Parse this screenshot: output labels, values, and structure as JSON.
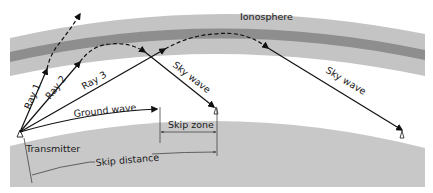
{
  "diagram": {
    "labels": {
      "ionosphere": "Ionosphere",
      "ray1": "Ray 1",
      "ray2": "Ray 2",
      "ray3": "Ray 3",
      "ground_wave": "Ground wave",
      "sky_wave_1": "Sky wave",
      "sky_wave_2": "Sky wave",
      "skip_zone": "Skip zone",
      "transmitter": "Transmitter",
      "skip_distance": "Skip distance"
    },
    "colors": {
      "ionosphere_outer": "#c4c4c4",
      "ionosphere_inner": "#8e8e8e",
      "ground": "#c8c8c8",
      "ray": "#111111"
    }
  }
}
